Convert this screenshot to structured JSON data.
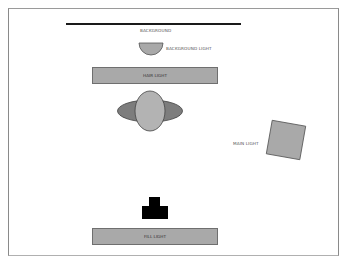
{
  "diagram": {
    "labels": {
      "background": "BACKGROUND",
      "background_light": "BACKGROUND LIGHT",
      "hair_light": "HAIR LIGHT",
      "main_light": "MAIN LIGHT",
      "fill_light": "FILL LIGHT"
    },
    "elements": [
      {
        "id": "background",
        "shape": "line",
        "color": "#1a1a1a"
      },
      {
        "id": "background-light",
        "shape": "half-circle",
        "color": "#a9a9a9"
      },
      {
        "id": "hair-light",
        "shape": "rectangle",
        "color": "#a9a9a9"
      },
      {
        "id": "subject",
        "shape": "head-and-shoulders",
        "head_color": "#b3b3b3",
        "shoulder_color": "#7d7d7d"
      },
      {
        "id": "main-light",
        "shape": "rotated-square",
        "color": "#a9a9a9",
        "rotation_deg": 10
      },
      {
        "id": "camera",
        "shape": "camera",
        "color": "#000000"
      },
      {
        "id": "fill-light",
        "shape": "rectangle",
        "color": "#a9a9a9"
      }
    ]
  }
}
